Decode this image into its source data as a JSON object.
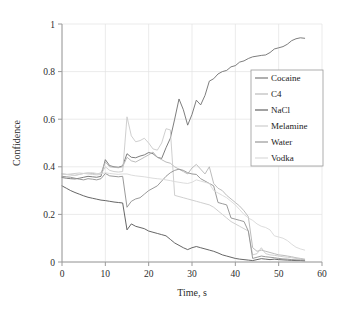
{
  "chart_data": {
    "type": "line",
    "title": "",
    "xlabel": "Time, s",
    "ylabel": "Confidence",
    "xlim": [
      0,
      60
    ],
    "ylim": [
      0,
      1
    ],
    "xticks": [
      0,
      10,
      20,
      30,
      40,
      50,
      60
    ],
    "xtick_labels": [
      "0",
      "10",
      "20",
      "30",
      "40",
      "50",
      "60"
    ],
    "yticks": [
      0,
      0.2,
      0.4,
      0.6,
      0.8,
      1
    ],
    "ytick_labels": [
      "0",
      "0.2",
      "0.4",
      "0.6",
      "0.8",
      "1"
    ],
    "grid": true,
    "legend_position": "center-right",
    "series": [
      {
        "name": "Cocaine",
        "color": "#6e6e6e",
        "x": [
          0,
          1,
          2,
          3,
          4,
          5,
          6,
          7,
          8,
          9,
          10,
          11,
          12,
          13,
          14,
          15,
          16,
          17,
          18,
          19,
          20,
          21,
          22,
          23,
          24,
          25,
          26,
          27,
          28,
          29,
          30,
          31,
          32,
          33,
          34,
          35,
          36,
          37,
          38,
          39,
          40,
          41,
          42,
          43,
          44,
          45,
          46,
          47,
          48,
          49,
          50,
          51,
          52,
          53,
          54,
          55,
          56
        ],
        "y": [
          0.355,
          0.352,
          0.35,
          0.349,
          0.352,
          0.356,
          0.36,
          0.358,
          0.356,
          0.36,
          0.43,
          0.405,
          0.4,
          0.398,
          0.404,
          0.455,
          0.44,
          0.438,
          0.445,
          0.45,
          0.46,
          0.455,
          0.44,
          0.435,
          0.48,
          0.52,
          0.6,
          0.685,
          0.64,
          0.575,
          0.62,
          0.68,
          0.66,
          0.7,
          0.76,
          0.77,
          0.79,
          0.8,
          0.805,
          0.82,
          0.825,
          0.84,
          0.845,
          0.855,
          0.862,
          0.865,
          0.868,
          0.87,
          0.88,
          0.895,
          0.9,
          0.905,
          0.915,
          0.93,
          0.938,
          0.942,
          0.94
        ]
      },
      {
        "name": "C4",
        "color": "#b4b4b4",
        "x": [
          0,
          1,
          2,
          3,
          4,
          5,
          6,
          7,
          8,
          9,
          10,
          11,
          12,
          13,
          14,
          15,
          16,
          17,
          18,
          19,
          20,
          21,
          22,
          23,
          24,
          25,
          26,
          27,
          28,
          29,
          30,
          31,
          32,
          33,
          34,
          35,
          36,
          37,
          38,
          39,
          40,
          41,
          42,
          43,
          44,
          45,
          46,
          47,
          48,
          49,
          50,
          51,
          52,
          53,
          54,
          55,
          56
        ],
        "y": [
          0.37,
          0.368,
          0.366,
          0.364,
          0.368,
          0.372,
          0.374,
          0.372,
          0.37,
          0.374,
          0.42,
          0.4,
          0.398,
          0.396,
          0.4,
          0.44,
          0.425,
          0.42,
          0.43,
          0.44,
          0.45,
          0.462,
          0.44,
          0.43,
          0.42,
          0.415,
          0.4,
          0.39,
          0.38,
          0.37,
          0.395,
          0.41,
          0.39,
          0.37,
          0.4,
          0.33,
          0.31,
          0.3,
          0.28,
          0.265,
          0.25,
          0.235,
          0.215,
          0.19,
          0.06,
          0.045,
          0.05,
          0.045,
          0.04,
          0.035,
          0.03,
          0.028,
          0.025,
          0.022,
          0.018,
          0.015,
          0.012
        ]
      },
      {
        "name": "NaCl",
        "color": "#555555",
        "x": [
          0,
          1,
          2,
          3,
          4,
          5,
          6,
          7,
          8,
          9,
          10,
          11,
          12,
          13,
          14,
          15,
          16,
          17,
          18,
          19,
          20,
          21,
          22,
          23,
          24,
          25,
          26,
          27,
          28,
          29,
          30,
          31,
          32,
          33,
          34,
          35,
          36,
          37,
          38,
          39,
          40,
          41,
          42,
          43,
          44,
          45,
          46,
          47,
          48,
          49,
          50,
          51,
          52,
          53,
          54,
          55,
          56
        ],
        "y": [
          0.32,
          0.31,
          0.3,
          0.292,
          0.285,
          0.278,
          0.272,
          0.268,
          0.264,
          0.26,
          0.258,
          0.255,
          0.252,
          0.25,
          0.248,
          0.135,
          0.16,
          0.15,
          0.145,
          0.14,
          0.13,
          0.125,
          0.12,
          0.115,
          0.11,
          0.095,
          0.08,
          0.07,
          0.06,
          0.052,
          0.06,
          0.065,
          0.06,
          0.055,
          0.05,
          0.045,
          0.038,
          0.03,
          0.025,
          0.02,
          0.015,
          0.012,
          0.01,
          0.008,
          0.006,
          0.01,
          0.014,
          0.012,
          0.01,
          0.012,
          0.01,
          0.009,
          0.008,
          0.007,
          0.006,
          0.006,
          0.005
        ]
      },
      {
        "name": "Melamine",
        "color": "#c9c9c9",
        "x": [
          0,
          1,
          2,
          3,
          4,
          5,
          6,
          7,
          8,
          9,
          10,
          11,
          12,
          13,
          14,
          15,
          16,
          17,
          18,
          19,
          20,
          21,
          22,
          23,
          24,
          25,
          26,
          27,
          28,
          29,
          30,
          31,
          32,
          33,
          34,
          35,
          36,
          37,
          38,
          39,
          40,
          41,
          42,
          43,
          44,
          45,
          46,
          47,
          48,
          49,
          50,
          51,
          52,
          53,
          54,
          55,
          56
        ],
        "y": [
          0.37,
          0.368,
          0.37,
          0.372,
          0.374,
          0.372,
          0.37,
          0.368,
          0.366,
          0.368,
          0.4,
          0.385,
          0.38,
          0.378,
          0.38,
          0.61,
          0.53,
          0.505,
          0.51,
          0.52,
          0.5,
          0.475,
          0.47,
          0.5,
          0.56,
          0.555,
          0.28,
          0.275,
          0.27,
          0.265,
          0.26,
          0.255,
          0.25,
          0.245,
          0.24,
          0.23,
          0.215,
          0.2,
          0.185,
          0.17,
          0.16,
          0.15,
          0.14,
          0.13,
          0.03,
          0.035,
          0.06,
          0.035,
          0.03,
          0.028,
          0.025,
          0.022,
          0.02,
          0.018,
          0.015,
          0.012,
          0.01
        ]
      },
      {
        "name": "Water",
        "color": "#8f8f8f",
        "x": [
          0,
          1,
          2,
          3,
          4,
          5,
          6,
          7,
          8,
          9,
          10,
          11,
          12,
          13,
          14,
          15,
          16,
          17,
          18,
          19,
          20,
          21,
          22,
          23,
          24,
          25,
          26,
          27,
          28,
          29,
          30,
          31,
          32,
          33,
          34,
          35,
          36,
          37,
          38,
          39,
          40,
          41,
          42,
          43,
          44,
          45,
          46,
          47,
          48,
          49,
          50,
          51,
          52,
          53,
          54,
          55,
          56
        ],
        "y": [
          0.36,
          0.358,
          0.356,
          0.352,
          0.348,
          0.345,
          0.35,
          0.348,
          0.345,
          0.35,
          0.372,
          0.362,
          0.36,
          0.358,
          0.36,
          0.23,
          0.255,
          0.265,
          0.27,
          0.285,
          0.3,
          0.31,
          0.32,
          0.34,
          0.36,
          0.375,
          0.385,
          0.39,
          0.385,
          0.375,
          0.37,
          0.368,
          0.35,
          0.34,
          0.33,
          0.32,
          0.25,
          0.245,
          0.24,
          0.185,
          0.18,
          0.175,
          0.17,
          0.13,
          0.015,
          0.02,
          0.025,
          0.022,
          0.02,
          0.018,
          0.015,
          0.013,
          0.012,
          0.01,
          0.009,
          0.008,
          0.007
        ]
      },
      {
        "name": "Vodka",
        "color": "#d8d8d8",
        "x": [
          0,
          1,
          2,
          3,
          4,
          5,
          6,
          7,
          8,
          9,
          10,
          11,
          12,
          13,
          14,
          15,
          16,
          17,
          18,
          19,
          20,
          21,
          22,
          23,
          24,
          25,
          26,
          27,
          28,
          29,
          30,
          31,
          32,
          33,
          34,
          35,
          36,
          37,
          38,
          39,
          40,
          41,
          42,
          43,
          44,
          45,
          46,
          47,
          48,
          49,
          50,
          51,
          52,
          53,
          54,
          55,
          56
        ],
        "y": [
          0.37,
          0.368,
          0.366,
          0.364,
          0.368,
          0.372,
          0.374,
          0.376,
          0.372,
          0.37,
          0.375,
          0.372,
          0.37,
          0.368,
          0.37,
          0.37,
          0.365,
          0.362,
          0.36,
          0.358,
          0.355,
          0.352,
          0.35,
          0.348,
          0.345,
          0.342,
          0.338,
          0.335,
          0.332,
          0.33,
          0.335,
          0.345,
          0.34,
          0.335,
          0.33,
          0.3,
          0.29,
          0.28,
          0.27,
          0.255,
          0.24,
          0.22,
          0.2,
          0.185,
          0.175,
          0.16,
          0.15,
          0.145,
          0.135,
          0.11,
          0.105,
          0.1,
          0.09,
          0.075,
          0.062,
          0.055,
          0.05
        ]
      }
    ]
  },
  "legend": {
    "entries": [
      {
        "label": "Cocaine"
      },
      {
        "label": "C4"
      },
      {
        "label": "NaCl"
      },
      {
        "label": "Melamine"
      },
      {
        "label": "Water"
      },
      {
        "label": "Vodka"
      }
    ]
  },
  "style": {
    "axis_color": "#9a9a9a",
    "grid_color": "#e2e2e2",
    "legend_border": "#9a9a9a",
    "text_color": "#2b2b2b",
    "background": "#ffffff"
  }
}
